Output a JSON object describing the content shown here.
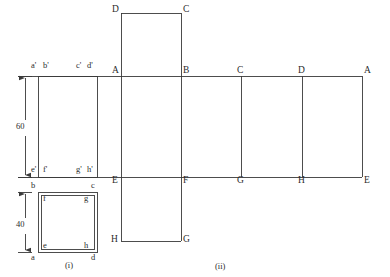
{
  "drawing": {
    "title_hidden": "",
    "figures": [
      {
        "id": "fig-i",
        "caption": "(i)",
        "x": 67,
        "y": 265
      },
      {
        "id": "fig-ii",
        "caption": "(ii)",
        "x": 218,
        "y": 266
      }
    ],
    "dimensions": [
      {
        "id": "dim-60",
        "value": "60",
        "x": 18,
        "y": 128,
        "orientation": "vertical",
        "from_y": 76,
        "to_y": 177,
        "line_x": 25
      },
      {
        "id": "dim-40",
        "value": "40",
        "x": 18,
        "y": 226,
        "orientation": "vertical",
        "from_y": 192,
        "to_y": 252,
        "line_x": 25
      }
    ],
    "elevation_labels": [
      {
        "id": "elev-a-prime",
        "text": "a'",
        "x": 31,
        "y": 66
      },
      {
        "id": "elev-b-prime",
        "text": "b'",
        "x": 43,
        "y": 66
      },
      {
        "id": "elev-c-prime",
        "text": "c'",
        "x": 76,
        "y": 66
      },
      {
        "id": "elev-d-prime",
        "text": "d'",
        "x": 88,
        "y": 66
      },
      {
        "id": "elev-e-prime",
        "text": "e'",
        "x": 31,
        "y": 169
      },
      {
        "id": "elev-f-prime",
        "text": "f'",
        "x": 43,
        "y": 169
      },
      {
        "id": "elev-g-prime",
        "text": "g'",
        "x": 76,
        "y": 169
      },
      {
        "id": "elev-h-prime",
        "text": "h'",
        "x": 87,
        "y": 169
      }
    ],
    "plan_labels": [
      {
        "id": "plan-b",
        "text": "b",
        "x": 31,
        "y": 184
      },
      {
        "id": "plan-c",
        "text": "c",
        "x": 91,
        "y": 184
      },
      {
        "id": "plan-f",
        "text": "f",
        "x": 42,
        "y": 196
      },
      {
        "id": "plan-g",
        "text": "g",
        "x": 84,
        "y": 196
      },
      {
        "id": "plan-e",
        "text": "e",
        "x": 42,
        "y": 244
      },
      {
        "id": "plan-h",
        "text": "h",
        "x": 84,
        "y": 244
      },
      {
        "id": "plan-a",
        "text": "a",
        "x": 31,
        "y": 256
      },
      {
        "id": "plan-d",
        "text": "d",
        "x": 91,
        "y": 256
      }
    ],
    "development_labels": [
      {
        "id": "dev-top-D",
        "text": "D",
        "x": 113,
        "y": 8
      },
      {
        "id": "dev-top-C",
        "text": "C",
        "x": 184,
        "y": 8
      },
      {
        "id": "dev-A-1",
        "text": "A",
        "x": 113,
        "y": 68
      },
      {
        "id": "dev-B",
        "text": "B",
        "x": 184,
        "y": 68
      },
      {
        "id": "dev-C",
        "text": "C",
        "x": 238,
        "y": 68
      },
      {
        "id": "dev-D",
        "text": "D",
        "x": 299,
        "y": 68
      },
      {
        "id": "dev-A-2",
        "text": "A",
        "x": 364,
        "y": 68
      },
      {
        "id": "dev-E-1",
        "text": "E",
        "x": 113,
        "y": 178
      },
      {
        "id": "dev-F",
        "text": "F",
        "x": 184,
        "y": 178
      },
      {
        "id": "dev-G",
        "text": "G",
        "x": 238,
        "y": 178
      },
      {
        "id": "dev-H",
        "text": "H",
        "x": 299,
        "y": 178
      },
      {
        "id": "dev-E-2",
        "text": "E",
        "x": 364,
        "y": 178
      },
      {
        "id": "dev-bottom-H",
        "text": "H",
        "x": 112,
        "y": 238
      },
      {
        "id": "dev-bottom-G",
        "text": "G",
        "x": 184,
        "y": 238
      }
    ],
    "geometry": {
      "stroke": "#3a3a3a",
      "stroke_width": 0.9,
      "elevation_box": {
        "x1": 38,
        "y1": 76,
        "x2": 97,
        "y2": 177
      },
      "plan_box_outer": {
        "x1": 38,
        "y1": 192,
        "x2": 97,
        "y2": 252
      },
      "plan_box_inner": {
        "x1": 41,
        "y1": 195,
        "x2": 94,
        "y2": 249
      },
      "dev_top_line_y": 76,
      "dev_bottom_line_y": 177,
      "dev_left_x": 121,
      "dev_right_x": 362,
      "dev_verticals_x": [
        121,
        181,
        241,
        302,
        362
      ],
      "top_flap": {
        "x1": 121,
        "y1": 13,
        "x2": 181,
        "y2": 76
      },
      "bottom_flap": {
        "x1": 121,
        "y1": 177,
        "x2": 181,
        "y2": 241
      }
    }
  }
}
